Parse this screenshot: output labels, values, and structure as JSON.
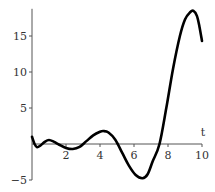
{
  "chart_data": {
    "type": "line",
    "title": "",
    "xlabel": "t",
    "ylabel": "",
    "xlim": [
      0,
      10
    ],
    "ylim": [
      -5,
      18.5
    ],
    "grid": false,
    "legend": null,
    "x_ticks": [
      2,
      4,
      6,
      8,
      10
    ],
    "x_tick_labels": [
      "2",
      "4",
      "6",
      "8",
      "10"
    ],
    "y_ticks": [
      -5,
      5,
      10,
      15
    ],
    "y_tick_labels": [
      "−5",
      "5",
      "10",
      "15"
    ],
    "series": [
      {
        "name": "curve",
        "x": [
          0,
          0.15,
          0.3,
          0.5,
          0.75,
          1.0,
          1.3,
          1.6,
          2.0,
          2.4,
          2.8,
          3.2,
          3.6,
          4.0,
          4.2,
          4.5,
          4.9,
          5.3,
          5.7,
          6.1,
          6.5,
          6.8,
          7.1,
          7.5,
          7.9,
          8.3,
          8.7,
          9.0,
          9.3,
          9.5,
          9.7,
          9.85,
          10.0
        ],
        "y": [
          1.0,
          0.0,
          -0.45,
          -0.2,
          0.3,
          0.55,
          0.3,
          -0.1,
          -0.55,
          -0.7,
          -0.4,
          0.4,
          1.2,
          1.7,
          1.8,
          1.6,
          0.6,
          -1.2,
          -3.0,
          -4.3,
          -4.75,
          -4.2,
          -2.4,
          0.0,
          5.0,
          10.5,
          15.0,
          17.3,
          18.3,
          18.5,
          17.8,
          16.3,
          14.3
        ]
      }
    ]
  }
}
